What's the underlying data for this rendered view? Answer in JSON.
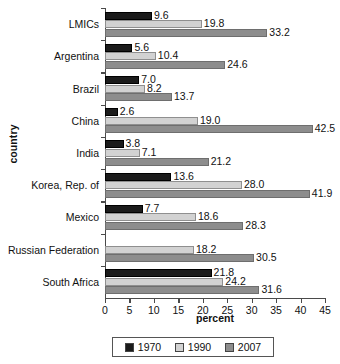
{
  "chart_data": {
    "type": "bar",
    "orientation": "horizontal",
    "title": "",
    "xlabel": "percent",
    "ylabel": "country",
    "xlim": [
      0,
      45
    ],
    "xticks": [
      0,
      5,
      10,
      15,
      20,
      25,
      30,
      35,
      40,
      45
    ],
    "grid": false,
    "legend_position": "bottom",
    "categories": [
      "LMICs",
      "Argentina",
      "Brazil",
      "China",
      "India",
      "Korea, Rep. of",
      "Mexico",
      "Russian Federation",
      "South Africa"
    ],
    "series": [
      {
        "name": "1970",
        "color": "#1b1b1b",
        "values": [
          9.6,
          5.6,
          7.0,
          2.6,
          3.8,
          13.6,
          7.7,
          null,
          21.8
        ],
        "labels": [
          "9.6",
          "5.6",
          "7.0",
          "2.6",
          "3.8",
          "13.6",
          "7.7",
          "",
          "21.8"
        ]
      },
      {
        "name": "1990",
        "color": "#d2d2d2",
        "values": [
          19.8,
          10.4,
          8.2,
          19.0,
          7.1,
          28.0,
          18.6,
          18.2,
          24.2
        ],
        "labels": [
          "19.8",
          "10.4",
          "8.2",
          "19.0",
          "7.1",
          "28.0",
          "18.6",
          "18.2",
          "24.2"
        ]
      },
      {
        "name": "2007",
        "color": "#8d8d8d",
        "values": [
          33.2,
          24.6,
          13.7,
          42.5,
          21.2,
          41.9,
          28.3,
          30.5,
          31.6
        ],
        "labels": [
          "33.2",
          "24.6",
          "13.7",
          "42.5",
          "21.2",
          "41.9",
          "28.3",
          "30.5",
          "31.6"
        ]
      }
    ]
  }
}
